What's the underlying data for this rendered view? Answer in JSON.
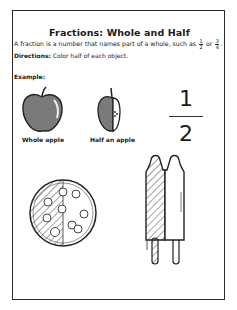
{
  "worksheet": {
    "title": "Fractions: Whole and Half",
    "description_prefix": "A fraction is a number that names part of a whole, such as",
    "inline_fractions": [
      {
        "numerator": "1",
        "denominator": "2"
      },
      {
        "numerator": "3",
        "denominator": "4"
      }
    ],
    "description_connector": "or",
    "description_suffix": ".",
    "directions_label": "Directions:",
    "directions_text": "Color half of each object.",
    "example_label": "Example:",
    "example_items": [
      {
        "label": "Whole apple",
        "icon": "whole-apple-icon"
      },
      {
        "label": "Half an apple",
        "icon": "half-apple-icon"
      }
    ],
    "big_fraction": {
      "numerator": "1",
      "denominator": "2"
    },
    "objects_to_color": [
      {
        "name": "pizza",
        "icon": "pizza-icon"
      },
      {
        "name": "twin popsicle",
        "icon": "popsicle-icon"
      }
    ],
    "colors": {
      "border": "#2a2a2a",
      "apple_fill": "#7a7a7a",
      "hatch": "#333333"
    }
  }
}
